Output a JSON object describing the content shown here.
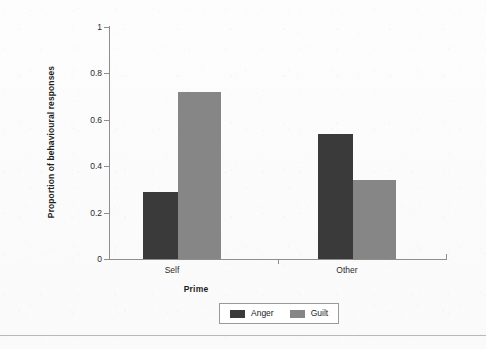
{
  "chart_data": {
    "type": "bar",
    "title": "",
    "subtitle": "",
    "xlabel": "Prime",
    "ylabel": "Proportion of behavioural responses",
    "categories": [
      "Self",
      "Other"
    ],
    "series": [
      {
        "name": "Anger",
        "color": "#3a3a3a",
        "values": [
          0.29,
          0.54
        ]
      },
      {
        "name": "Guilt",
        "color": "#868686",
        "values": [
          0.72,
          0.34
        ]
      }
    ],
    "ylim": [
      0,
      1
    ],
    "yticks": [
      0,
      0.2,
      0.4,
      0.6,
      0.8,
      1
    ],
    "ytick_labels": [
      "0",
      "0.2",
      "0.4",
      "0.6",
      "0.8",
      "1"
    ],
    "grid": false,
    "legend_position": "bottom-center",
    "background_color": "#fafafa",
    "axis_color": "#8e8e8e"
  },
  "legend": {
    "entries": [
      {
        "label": "Anger",
        "color": "#3a3a3a"
      },
      {
        "label": "Guilt",
        "color": "#868686"
      }
    ]
  }
}
